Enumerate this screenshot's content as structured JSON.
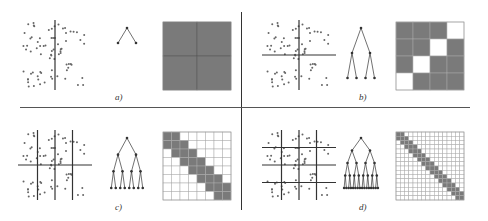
{
  "panels": [
    {
      "id": "a",
      "label": "a)",
      "cuts_v": [
        1
      ],
      "cuts_h": [],
      "tree_levels": 1,
      "matrix": {
        "grid": 2,
        "pattern": [
          [
            1,
            1
          ],
          [
            1,
            1
          ]
        ]
      }
    },
    {
      "id": "b",
      "label": "b)",
      "cuts_v": [
        1
      ],
      "cuts_h": [
        1
      ],
      "tree_levels": 2,
      "matrix": {
        "grid": 4,
        "pattern": [
          [
            1,
            1,
            1,
            0
          ],
          [
            1,
            1,
            0,
            1
          ],
          [
            1,
            0,
            1,
            1
          ],
          [
            0,
            1,
            1,
            1
          ]
        ]
      }
    },
    {
      "id": "c",
      "label": "c)",
      "cuts_v": [
        0.5,
        1,
        1.5
      ],
      "cuts_h": [
        1
      ],
      "tree_levels": 3,
      "matrix": {
        "grid": 8,
        "pattern": "hierarchical-level-3"
      }
    },
    {
      "id": "d",
      "label": "d)",
      "cuts_v": [
        0.5,
        1,
        1.5
      ],
      "cuts_h": [
        0.5,
        1,
        1.5
      ],
      "tree_levels": 4,
      "matrix": {
        "grid": 16,
        "pattern": "hierarchical-level-4"
      }
    }
  ],
  "colors": {
    "fill": "#7a7a7a",
    "line": "#333333",
    "point": "#666666",
    "background": "#ffffff",
    "grid": "#aaaaaa"
  }
}
